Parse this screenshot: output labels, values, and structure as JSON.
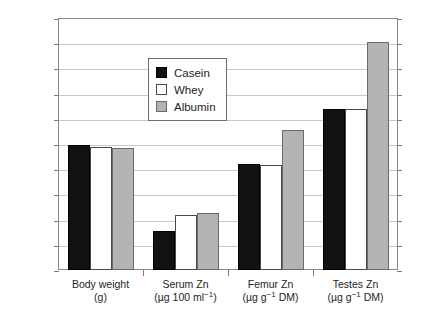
{
  "chart_data": {
    "type": "bar",
    "title": "",
    "xlabel": "",
    "ylabel": "",
    "ylim": [
      0,
      200
    ],
    "ytick_step": 20,
    "yticks": [
      0,
      20,
      40,
      60,
      80,
      100,
      120,
      140,
      160,
      180,
      200
    ],
    "ytick_labels": [
      "0",
      "20",
      "40",
      "60",
      "80",
      "100",
      "120",
      "140",
      "160",
      "180",
      "200"
    ],
    "grid": true,
    "grid_axis": "y",
    "legend_position": "inside upper-left-center",
    "categories": [
      "Body weight (g)",
      "Serum Zn (µg 100 ml⁻¹)",
      "Femur Zn (µg g⁻¹ DM)",
      "Testes Zn (µg g⁻¹ DM)"
    ],
    "category_labels": [
      {
        "name": "Body weight",
        "unit_prefix": "(g",
        "unit_sup": "",
        "unit_suffix": ")"
      },
      {
        "name": "Serum Zn",
        "unit_prefix": "(µg 100 ml",
        "unit_sup": "−1",
        "unit_suffix": ")"
      },
      {
        "name": "Femur Zn",
        "unit_prefix": "(µg g",
        "unit_sup": "−1",
        "unit_suffix": " DM)"
      },
      {
        "name": "Testes Zn",
        "unit_prefix": "(µg g",
        "unit_sup": "−1",
        "unit_suffix": " DM)"
      }
    ],
    "series": [
      {
        "name": "Casein",
        "color": "#121212",
        "values": [
          99,
          31,
          84,
          128
        ]
      },
      {
        "name": "Whey",
        "color": "#ffffff",
        "values": [
          98,
          44,
          83,
          128
        ]
      },
      {
        "name": "Albumin",
        "color": "#b4b4b4",
        "values": [
          97,
          45,
          111,
          181
        ]
      }
    ]
  },
  "legend": {
    "items": [
      {
        "label": "Casein",
        "key": "casein"
      },
      {
        "label": "Whey",
        "key": "whey"
      },
      {
        "label": "Albumin",
        "key": "albumin"
      }
    ]
  }
}
